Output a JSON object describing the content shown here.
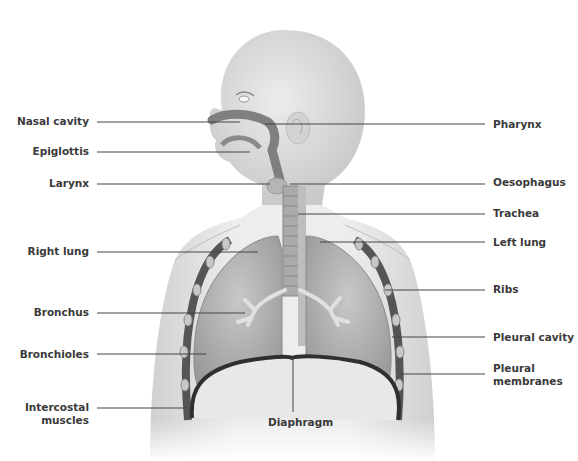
{
  "diagram": {
    "colors": {
      "body": "#e6e6e6",
      "body_shade": "#cfcfcf",
      "airway": "#8a8a8a",
      "lung": "#b9b9b9",
      "diaphragm": "#3a3a3a",
      "leader_line": "#444444",
      "label_text": "#3a3a3a"
    },
    "labels_left": [
      {
        "id": "nasal-cavity",
        "text": "Nasal cavity",
        "y": 121
      },
      {
        "id": "epiglottis",
        "text": "Epiglottis",
        "y": 152
      },
      {
        "id": "larynx",
        "text": "Larynx",
        "y": 184
      },
      {
        "id": "right-lung",
        "text": "Right lung",
        "y": 252
      },
      {
        "id": "bronchus",
        "text": "Bronchus",
        "y": 313
      },
      {
        "id": "bronchioles",
        "text": "Bronchioles",
        "y": 355
      },
      {
        "id": "intercostal-muscles",
        "text": "Intercostal muscles",
        "line1": "Intercostal",
        "line2": "muscles",
        "y": 408
      }
    ],
    "labels_right": [
      {
        "id": "pharynx",
        "text": "Pharynx",
        "y": 124
      },
      {
        "id": "oesophagus",
        "text": "Oesophagus",
        "y": 182
      },
      {
        "id": "trachea",
        "text": "Trachea",
        "y": 213
      },
      {
        "id": "left-lung",
        "text": "Left lung",
        "y": 242
      },
      {
        "id": "ribs",
        "text": "Ribs",
        "y": 289
      },
      {
        "id": "pleural-cavity",
        "text": "Pleural cavity",
        "y": 337
      },
      {
        "id": "pleural-membranes",
        "text": "Pleural membranes",
        "line1": "Pleural",
        "line2": "membranes",
        "y": 374
      }
    ],
    "label_bottom": {
      "id": "diaphragm",
      "text": "Diaphragm"
    }
  }
}
